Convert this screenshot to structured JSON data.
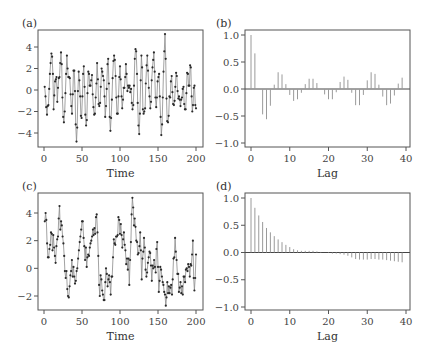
{
  "figure": {
    "width": 429,
    "height": 363,
    "colors": {
      "frame": "#555555",
      "line": "#8a8a8a",
      "marker": "#2a2a2a",
      "bar": "#9a9a9a",
      "zero": "#444444"
    }
  },
  "chart_data": [
    {
      "id": "a",
      "panel_label": "(a)",
      "type": "line",
      "title": "",
      "xlabel": "Time",
      "ylabel": "",
      "xlim": [
        0,
        200
      ],
      "ylim": [
        -5,
        5.5
      ],
      "xticks": [
        0,
        50,
        100,
        150,
        200
      ],
      "yticks": [
        -4,
        -2,
        0,
        2,
        4
      ],
      "markers": true,
      "grid": false,
      "frame": {
        "x0": 38,
        "x1": 203,
        "y0": 30,
        "y1": 147,
        "xpix0": 44,
        "xpix1": 196,
        "ypix_at_top": 47,
        "yval_at_top": 4,
        "ypix_at_bottom": 133,
        "yval_at_bottom": -4
      },
      "x": "1..200",
      "values": [
        0.3,
        -0.6,
        -1.6,
        -2.3,
        -1.5,
        -1.4,
        0.1,
        1.5,
        2.5,
        3.4,
        3.1,
        1.5,
        -1.8,
        -0.5,
        0.8,
        1.0,
        1.2,
        -1.1,
        0.2,
        1.1,
        1.2,
        2.5,
        3.5,
        2.4,
        -0.7,
        -2.5,
        -3.0,
        -2.0,
        -0.3,
        1.5,
        3.2,
        2.0,
        1.2,
        1.2,
        1.1,
        -0.4,
        -1.5,
        -2.2,
        -0.4,
        1.8,
        1.8,
        -0.1,
        -3.2,
        -4.8,
        -3.5,
        -0.1,
        1.7,
        0.9,
        -0.6,
        -2.4,
        -2.6,
        -0.6,
        1.5,
        2.2,
        0.3,
        -2.3,
        -3.3,
        -2.8,
        -0.3,
        1.7,
        1.5,
        0.4,
        0.4,
        0.9,
        1.4,
        -0.4,
        -1.6,
        -2.3,
        -2.2,
        -0.7,
        0.6,
        2.5,
        1.0,
        -1.3,
        -1.5,
        -1.2,
        0.3,
        2.0,
        1.7,
        1.3,
        0.9,
        -0.6,
        -2.5,
        -1.5,
        0.1,
        2.4,
        2.9,
        0.6,
        -2.5,
        -3.8,
        -2.6,
        -0.9,
        1.1,
        2.7,
        3.2,
        2.8,
        1.3,
        -0.7,
        -2.2,
        -2.2,
        -0.6,
        1.2,
        2.2,
        1.0,
        -0.6,
        -1.7,
        -0.9,
        0.2,
        0.2,
        1.2,
        2.4,
        1.5,
        -0.1,
        0.4,
        0.2,
        0.4,
        -0.2,
        0.1,
        -1.2,
        -1.8,
        -1.4,
        0.4,
        2.9,
        3.8,
        3.6,
        1.5,
        -1.2,
        -3.3,
        -4.1,
        -2.2,
        0.9,
        3.2,
        2.1,
        -1.8,
        -2.2,
        -2.0,
        -1.7,
        0.6,
        2.3,
        3.2,
        1.8,
        0.2,
        -0.6,
        -1.7,
        -1.1,
        0.9,
        2.1,
        2.8,
        3.5,
        1.7,
        -0.7,
        -1.6,
        -0.7,
        0.8,
        1.2,
        1.5,
        -0.6,
        -2.5,
        -4.2,
        -3.2,
        -0.7,
        1.7,
        3.6,
        5.2,
        2.9,
        -0.8,
        -2.9,
        -3.0,
        -2.4,
        -0.6,
        -0.7,
        0.8,
        1.3,
        -0.2,
        -1.3,
        -1.4,
        -1.0,
        0.3,
        1.6,
        1.3,
        -0.1,
        -0.8,
        -0.6,
        -0.9,
        -1.5,
        -0.9,
        -0.7,
        0.1,
        0.3,
        -1.3,
        -1.8,
        -1.8,
        -0.3,
        1.6,
        1.5,
        0.4,
        0.4,
        2.3,
        2.1,
        -0.6,
        -2.0,
        -1.4,
        0.2,
        0.4,
        -1.4,
        -1.7
      ]
    },
    {
      "id": "b",
      "panel_label": "(b)",
      "type": "bar",
      "subtype": "acf-stem",
      "title": "",
      "xlabel": "Lag",
      "ylabel": "",
      "xlim": [
        0,
        40
      ],
      "ylim": [
        -1.0,
        1.0
      ],
      "xticks": [
        0,
        10,
        20,
        30,
        40
      ],
      "yticks": [
        -1.0,
        -0.5,
        0.0,
        0.5,
        1.0
      ],
      "ytick_labels": [
        "-1.0",
        "-0.5",
        "0.0",
        "0.5",
        "1.0"
      ],
      "grid": false,
      "frame": {
        "x0": 245,
        "x1": 410,
        "y0": 30,
        "y1": 147,
        "xpix0": 251,
        "xpix1": 406,
        "ypix_at_top": 35,
        "yval_at_top": 1.0,
        "ypix_at_bottom": 143,
        "yval_at_bottom": -1.0
      },
      "categories": [
        0,
        1,
        2,
        3,
        4,
        5,
        6,
        7,
        8,
        9,
        10,
        11,
        12,
        13,
        14,
        15,
        16,
        17,
        18,
        19,
        20,
        21,
        22,
        23,
        24,
        25,
        26,
        27,
        28,
        29,
        30,
        31,
        32,
        33,
        34,
        35,
        36,
        37,
        38,
        39,
        40
      ],
      "values": [
        1.0,
        0.66,
        0.0,
        -0.47,
        -0.56,
        -0.31,
        0.08,
        0.31,
        0.27,
        0.09,
        -0.11,
        -0.22,
        -0.19,
        -0.07,
        0.09,
        0.19,
        0.19,
        0.11,
        0.0,
        -0.1,
        -0.19,
        -0.19,
        -0.06,
        0.13,
        0.23,
        0.17,
        -0.07,
        -0.3,
        -0.3,
        -0.11,
        0.16,
        0.31,
        0.28,
        0.08,
        -0.14,
        -0.3,
        -0.27,
        -0.12,
        0.1,
        0.21,
        0.0
      ]
    },
    {
      "id": "c",
      "panel_label": "(c)",
      "type": "line",
      "title": "",
      "xlabel": "Time",
      "ylabel": "",
      "xlim": [
        0,
        200
      ],
      "ylim": [
        -3,
        5.2
      ],
      "xticks": [
        0,
        50,
        100,
        150,
        200
      ],
      "yticks": [
        -2,
        0,
        2,
        4
      ],
      "markers": true,
      "grid": false,
      "frame": {
        "x0": 38,
        "x1": 203,
        "y0": 193,
        "y1": 310,
        "xpix0": 44,
        "xpix1": 196,
        "ypix_at_top": 213,
        "yval_at_top": 4,
        "ypix_at_bottom": 296,
        "yval_at_bottom": -2
      },
      "x": "1..200",
      "values": [
        3.4,
        4.0,
        3.5,
        1.8,
        0.8,
        0.8,
        1.4,
        1.7,
        2.6,
        2.5,
        1.3,
        2.4,
        1.5,
        0.9,
        0.4,
        1.6,
        2.1,
        2.3,
        3.6,
        4.5,
        2.8,
        3.4,
        3.1,
        2.3,
        1.8,
        0.9,
        -0.2,
        -0.7,
        -0.2,
        -1.5,
        -2.0,
        -2.1,
        -1.3,
        -0.5,
        -0.2,
        0.6,
        -0.6,
        0.1,
        -0.6,
        -1.1,
        -0.9,
        -0.2,
        0.0,
        0.7,
        1.3,
        1.9,
        2.3,
        2.8,
        3.4,
        3.4,
        2.2,
        1.6,
        0.6,
        1.5,
        0.1,
        0.8,
        1.0,
        0.9,
        1.5,
        1.8,
        2.0,
        2.3,
        2.8,
        2.4,
        2.9,
        2.5,
        3.7,
        3.9,
        2.6,
        0.9,
        -1.2,
        -2.0,
        -0.5,
        -0.8,
        -1.6,
        -1.9,
        -2.3,
        -2.3,
        -1.0,
        0.0,
        -0.4,
        -1.3,
        -0.8,
        -0.5,
        -1.0,
        -1.9,
        -0.6,
        -0.6,
        0.8,
        2.1,
        1.8,
        1.7,
        2.3,
        2.3,
        2.4,
        3.7,
        3.5,
        2.5,
        3.2,
        2.4,
        1.5,
        2.1,
        2.6,
        1.7,
        1.3,
        0.3,
        0.7,
        -0.1,
        0.7,
        -1.2,
        0.6,
        1.9,
        3.9,
        5.1,
        4.4,
        3.1,
        3.6,
        3.0,
        2.0,
        1.9,
        1.0,
        1.1,
        1.6,
        2.6,
        1.3,
        -0.8,
        0.7,
        1.2,
        2.2,
        1.5,
        -0.1,
        -0.6,
        -0.3,
        0.4,
        0.8,
        1.2,
        1.1,
        0.2,
        -0.9,
        0.2,
        0.0,
        0.6,
        0.1,
        -0.3,
        1.4,
        1.9,
        0.1,
        -1.7,
        -0.9,
        0.1,
        -0.1,
        -0.6,
        -1.0,
        -1.2,
        -1.7,
        -1.9,
        -2.7,
        -2.1,
        -1.0,
        -1.8,
        -1.3,
        -1.8,
        -1.4,
        -1.2,
        -1.9,
        -0.8,
        0.7,
        0.8,
        2.2,
        1.2,
        0.6,
        -0.4,
        -0.4,
        -1.7,
        -1.4,
        -1.0,
        -1.8,
        -1.3,
        -1.9,
        -0.6,
        -0.6,
        -1.0,
        -0.1,
        0.0,
        -0.2,
        0.3,
        0.1,
        -0.6,
        0.3,
        0.2,
        1.0,
        2.0,
        -0.7,
        -1.6,
        -0.7,
        1.0
      ]
    },
    {
      "id": "d",
      "panel_label": "(d)",
      "type": "bar",
      "subtype": "acf-stem",
      "title": "",
      "xlabel": "Lag",
      "ylabel": "",
      "xlim": [
        0,
        40
      ],
      "ylim": [
        -1.0,
        1.0
      ],
      "xticks": [
        0,
        10,
        20,
        30,
        40
      ],
      "yticks": [
        -1.0,
        -0.5,
        0.0,
        0.5,
        1.0
      ],
      "ytick_labels": [
        "-1.0",
        "-0.5",
        "0.0",
        "0.5",
        "1.0"
      ],
      "grid": false,
      "frame": {
        "x0": 245,
        "x1": 410,
        "y0": 193,
        "y1": 310,
        "xpix0": 251,
        "xpix1": 406,
        "ypix_at_top": 198,
        "yval_at_top": 1.0,
        "ypix_at_bottom": 307,
        "yval_at_bottom": -1.0
      },
      "categories": [
        0,
        1,
        2,
        3,
        4,
        5,
        6,
        7,
        8,
        9,
        10,
        11,
        12,
        13,
        14,
        15,
        16,
        17,
        18,
        19,
        20,
        21,
        22,
        23,
        24,
        25,
        26,
        27,
        28,
        29,
        30,
        31,
        32,
        33,
        34,
        35,
        36,
        37,
        38,
        39,
        40
      ],
      "values": [
        1.0,
        0.82,
        0.68,
        0.56,
        0.45,
        0.37,
        0.3,
        0.24,
        0.19,
        0.14,
        0.1,
        0.06,
        0.04,
        0.03,
        0.03,
        0.03,
        0.03,
        0.02,
        0.01,
        0.0,
        -0.01,
        -0.02,
        -0.02,
        -0.03,
        -0.04,
        -0.06,
        -0.09,
        -0.12,
        -0.13,
        -0.13,
        -0.13,
        -0.12,
        -0.12,
        -0.13,
        -0.13,
        -0.14,
        -0.15,
        -0.16,
        -0.17,
        -0.18,
        0.0
      ]
    }
  ]
}
